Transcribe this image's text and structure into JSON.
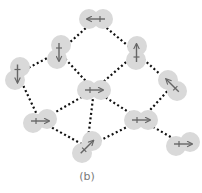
{
  "caption": "(b)",
  "colors": {
    "node_fill": "#d9d9d9",
    "arrow": "#666666",
    "edge": "#111111",
    "caption": "#7a7a7a"
  },
  "nodes": [
    {
      "id": "top",
      "c1": [
        89,
        19
      ],
      "c2": [
        103,
        19
      ],
      "arrow": "left"
    },
    {
      "id": "upper-left",
      "c1": [
        61,
        45
      ],
      "c2": [
        57,
        59
      ],
      "arrow": "down"
    },
    {
      "id": "left",
      "c1": [
        20,
        67
      ],
      "c2": [
        15,
        80
      ],
      "arrow": "down"
    },
    {
      "id": "upper-right",
      "c1": [
        137,
        46
      ],
      "c2": [
        136,
        60
      ],
      "arrow": "up"
    },
    {
      "id": "right",
      "c1": [
        168,
        80
      ],
      "c2": [
        177,
        91
      ],
      "arrow": "up-left"
    },
    {
      "id": "center",
      "c1": [
        87,
        90
      ],
      "c2": [
        101,
        90
      ],
      "arrow": "right"
    },
    {
      "id": "lower-left",
      "c1": [
        33,
        123
      ],
      "c2": [
        47,
        119
      ],
      "arrow": "right"
    },
    {
      "id": "bottom",
      "c1": [
        82,
        153
      ],
      "c2": [
        92,
        141
      ],
      "arrow": "up-right"
    },
    {
      "id": "mid-right",
      "c1": [
        134,
        120
      ],
      "c2": [
        148,
        120
      ],
      "arrow": "right"
    },
    {
      "id": "lower-right",
      "c1": [
        176,
        146
      ],
      "c2": [
        190,
        142
      ],
      "arrow": "right"
    }
  ],
  "edges": [
    [
      "top",
      "upper-left"
    ],
    [
      "top",
      "upper-right"
    ],
    [
      "upper-left",
      "left"
    ],
    [
      "upper-left",
      "center"
    ],
    [
      "upper-right",
      "center"
    ],
    [
      "upper-right",
      "right"
    ],
    [
      "left",
      "lower-left"
    ],
    [
      "center",
      "lower-left"
    ],
    [
      "center",
      "bottom"
    ],
    [
      "center",
      "mid-right"
    ],
    [
      "lower-left",
      "bottom"
    ],
    [
      "bottom",
      "mid-right"
    ],
    [
      "mid-right",
      "right"
    ],
    [
      "mid-right",
      "lower-right"
    ]
  ]
}
